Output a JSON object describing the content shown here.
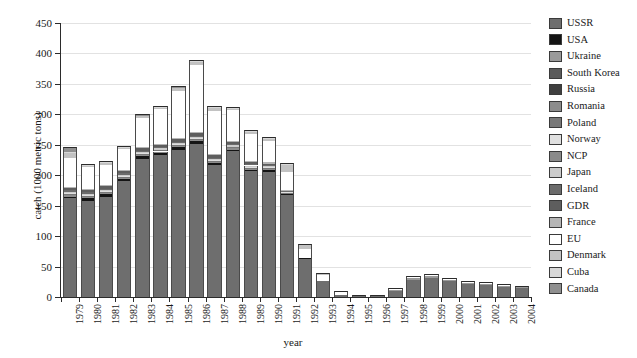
{
  "chart_data": {
    "type": "bar",
    "subtype": "stacked",
    "title": "",
    "xlabel": "year",
    "ylabel": "catch (1000 metric tons)",
    "ylim": [
      0,
      450
    ],
    "yticks": [
      0,
      50,
      100,
      150,
      200,
      250,
      300,
      350,
      400,
      450
    ],
    "grid": true,
    "legend_position": "right",
    "categories": [
      "1979",
      "1980",
      "1981",
      "1982",
      "1983",
      "1984",
      "1985",
      "1986",
      "1987",
      "1988",
      "1989",
      "1990",
      "1991",
      "1992",
      "1993",
      "1994",
      "1995",
      "1996",
      "1997",
      "1998",
      "1999",
      "2000",
      "2001",
      "2002",
      "2003",
      "2004"
    ],
    "series": [
      {
        "name": "USSR",
        "color": "#6e6e6e",
        "values": [
          162,
          157,
          165,
          190,
          227,
          233,
          241,
          251,
          217,
          239,
          207,
          206,
          167,
          63,
          26,
          3,
          1,
          1,
          10,
          28,
          31,
          26,
          21,
          20,
          17,
          14
        ]
      },
      {
        "name": "USA",
        "color": "#141414",
        "values": [
          3,
          6,
          4,
          4,
          4,
          4,
          5,
          5,
          3,
          3,
          2,
          2,
          2,
          1,
          0,
          0,
          0,
          0,
          0,
          0,
          0,
          0,
          0,
          0,
          0,
          0
        ]
      },
      {
        "name": "Ukraine",
        "color": "#9a9a9a",
        "values": [
          0,
          0,
          0,
          0,
          0,
          0,
          0,
          0,
          0,
          0,
          0,
          0,
          0,
          0,
          0,
          0,
          0,
          0,
          1,
          3,
          3,
          2,
          2,
          2,
          2,
          2
        ]
      },
      {
        "name": "South Korea",
        "color": "#5a5a5a",
        "values": [
          0,
          0,
          0,
          0,
          0,
          0,
          0,
          0,
          0,
          0,
          0,
          0,
          0,
          0,
          0,
          0,
          0,
          0,
          0,
          0,
          0,
          0,
          0,
          0,
          0,
          0
        ]
      },
      {
        "name": "Russia",
        "color": "#3f3f3f",
        "values": [
          0,
          0,
          0,
          0,
          0,
          0,
          0,
          0,
          0,
          0,
          0,
          0,
          0,
          0,
          0,
          0,
          0,
          0,
          0,
          0,
          0,
          0,
          0,
          0,
          0,
          0
        ]
      },
      {
        "name": "Romania",
        "color": "#8c8c8c",
        "values": [
          3,
          2,
          2,
          2,
          2,
          2,
          2,
          2,
          2,
          2,
          2,
          2,
          1,
          0,
          0,
          0,
          0,
          0,
          0,
          0,
          0,
          0,
          0,
          0,
          0,
          0
        ]
      },
      {
        "name": "Poland",
        "color": "#787878",
        "values": [
          2,
          2,
          2,
          2,
          2,
          2,
          2,
          2,
          2,
          2,
          2,
          2,
          1,
          0,
          0,
          0,
          0,
          0,
          0,
          0,
          0,
          0,
          0,
          0,
          0,
          0
        ]
      },
      {
        "name": "Norway",
        "color": "#e0e0e0",
        "values": [
          1,
          1,
          1,
          1,
          1,
          1,
          1,
          1,
          1,
          1,
          1,
          1,
          1,
          0,
          0,
          0,
          0,
          0,
          0,
          0,
          0,
          0,
          0,
          0,
          0,
          0
        ]
      },
      {
        "name": "NCP",
        "color": "#8a8a8a",
        "values": [
          0,
          0,
          0,
          0,
          0,
          0,
          0,
          0,
          0,
          0,
          0,
          0,
          0,
          0,
          0,
          0,
          0,
          0,
          0,
          0,
          0,
          0,
          0,
          0,
          0,
          0
        ]
      },
      {
        "name": "Japan",
        "color": "#cbcbcb",
        "values": [
          2,
          2,
          2,
          2,
          2,
          2,
          2,
          2,
          2,
          2,
          2,
          2,
          1,
          0,
          0,
          0,
          0,
          0,
          0,
          0,
          0,
          0,
          0,
          0,
          0,
          0
        ]
      },
      {
        "name": "Iceland",
        "color": "#6b6b6b",
        "values": [
          2,
          2,
          2,
          2,
          2,
          2,
          2,
          2,
          2,
          2,
          2,
          2,
          1,
          0,
          0,
          0,
          0,
          0,
          0,
          0,
          0,
          0,
          0,
          0,
          0,
          0
        ]
      },
      {
        "name": "GDR",
        "color": "#5e5e5e",
        "values": [
          4,
          4,
          4,
          4,
          4,
          4,
          4,
          4,
          4,
          4,
          3,
          2,
          1,
          0,
          0,
          0,
          0,
          0,
          0,
          0,
          0,
          0,
          0,
          0,
          0,
          0
        ]
      },
      {
        "name": "France",
        "color": "#b5b5b5",
        "values": [
          2,
          2,
          2,
          2,
          2,
          2,
          2,
          2,
          2,
          2,
          2,
          2,
          1,
          0,
          0,
          0,
          0,
          0,
          0,
          0,
          0,
          0,
          0,
          0,
          0,
          0
        ]
      },
      {
        "name": "EU",
        "color": "#ffffff",
        "values": [
          48,
          35,
          33,
          34,
          48,
          56,
          78,
          110,
          70,
          50,
          44,
          35,
          30,
          15,
          10,
          5,
          1,
          1,
          2,
          2,
          2,
          1,
          1,
          1,
          1,
          1
        ]
      },
      {
        "name": "Denmark",
        "color": "#c2c2c2",
        "values": [
          7,
          3,
          3,
          2,
          3,
          3,
          4,
          5,
          6,
          2,
          5,
          4,
          11,
          7,
          3,
          1,
          0,
          0,
          1,
          1,
          2,
          1,
          1,
          1,
          1,
          1
        ]
      },
      {
        "name": "Cuba",
        "color": "#d8d8d8",
        "values": [
          2,
          1,
          1,
          1,
          1,
          1,
          1,
          1,
          1,
          1,
          1,
          1,
          1,
          0,
          0,
          0,
          0,
          0,
          0,
          0,
          0,
          0,
          0,
          0,
          0,
          0
        ]
      },
      {
        "name": "Canada",
        "color": "#8f8f8f",
        "values": [
          8,
          2,
          2,
          2,
          2,
          2,
          2,
          2,
          2,
          2,
          1,
          1,
          1,
          1,
          0,
          0,
          0,
          0,
          0,
          0,
          0,
          0,
          0,
          0,
          0,
          0
        ]
      }
    ],
    "totals": [
      246,
      217,
      223,
      246,
      300,
      314,
      346,
      389,
      314,
      312,
      274,
      262,
      219,
      87,
      39,
      9,
      2,
      2,
      14,
      34,
      38,
      30,
      25,
      24,
      21,
      18
    ]
  },
  "legend": {
    "items": [
      {
        "label": "USSR"
      },
      {
        "label": "USA"
      },
      {
        "label": "Ukraine"
      },
      {
        "label": "South Korea"
      },
      {
        "label": "Russia"
      },
      {
        "label": "Romania"
      },
      {
        "label": "Poland"
      },
      {
        "label": "Norway"
      },
      {
        "label": "NCP"
      },
      {
        "label": "Japan"
      },
      {
        "label": "Iceland"
      },
      {
        "label": "GDR"
      },
      {
        "label": "France"
      },
      {
        "label": "EU"
      },
      {
        "label": "Denmark"
      },
      {
        "label": "Cuba"
      },
      {
        "label": "Canada"
      }
    ]
  }
}
